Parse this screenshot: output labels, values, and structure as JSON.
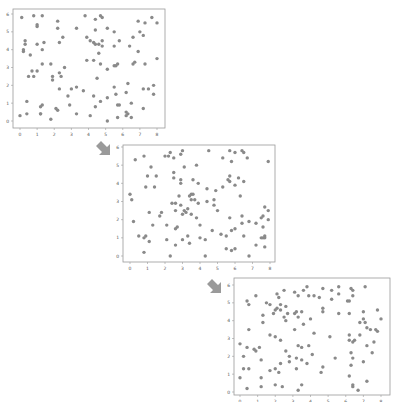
{
  "diagram": {
    "colors": {
      "point": "#8a8a8a",
      "frame": "#9a9a9a",
      "tick_text": "#555555",
      "arrow": "#9a9a9a"
    }
  },
  "chart_data": [
    {
      "type": "scatter",
      "title": "",
      "xlabel": "",
      "ylabel": "",
      "xlim": [
        -0.3,
        8.3
      ],
      "ylim": [
        -0.2,
        6.1
      ],
      "xticks": [
        "0",
        "1",
        "2",
        "3",
        "4",
        "5",
        "6",
        "7",
        "8"
      ],
      "yticks": [
        "0",
        "1",
        "2",
        "3",
        "4",
        "5",
        "6"
      ],
      "grid": false,
      "points": [
        [
          0.1,
          5.8
        ],
        [
          0.8,
          5.9
        ],
        [
          1.3,
          5.9
        ],
        [
          1.0,
          5.4
        ],
        [
          1.0,
          5.3
        ],
        [
          2.2,
          5.6
        ],
        [
          2.2,
          5.2
        ],
        [
          3.3,
          5.2
        ],
        [
          3.8,
          5.9
        ],
        [
          4.7,
          5.9
        ],
        [
          4.8,
          5.8
        ],
        [
          4.4,
          5.7
        ],
        [
          5.1,
          5.2
        ],
        [
          6.9,
          5.6
        ],
        [
          7.3,
          5.5
        ],
        [
          7.7,
          5.8
        ],
        [
          8.0,
          5.5
        ],
        [
          7.0,
          5.0
        ],
        [
          7.2,
          4.8
        ],
        [
          0.3,
          4.5
        ],
        [
          0.3,
          4.3
        ],
        [
          0.2,
          4.0
        ],
        [
          0.2,
          3.9
        ],
        [
          0.6,
          3.7
        ],
        [
          1.0,
          4.3
        ],
        [
          1.4,
          4.4
        ],
        [
          1.3,
          4.0
        ],
        [
          2.5,
          4.7
        ],
        [
          2.3,
          4.4
        ],
        [
          3.9,
          4.7
        ],
        [
          4.1,
          4.5
        ],
        [
          4.3,
          4.4
        ],
        [
          4.4,
          4.3
        ],
        [
          4.6,
          4.3
        ],
        [
          4.8,
          4.5
        ],
        [
          4.8,
          4.2
        ],
        [
          4.4,
          5.1
        ],
        [
          5.5,
          5.0
        ],
        [
          5.5,
          4.2
        ],
        [
          5.8,
          4.5
        ],
        [
          6.4,
          4.2
        ],
        [
          6.6,
          4.7
        ],
        [
          6.9,
          3.9
        ],
        [
          4.6,
          3.8
        ],
        [
          1.3,
          3.2
        ],
        [
          1.8,
          3.2
        ],
        [
          2.6,
          3.0
        ],
        [
          3.9,
          3.4
        ],
        [
          4.3,
          3.4
        ],
        [
          4.7,
          3.2
        ],
        [
          5.1,
          2.9
        ],
        [
          5.5,
          3.1
        ],
        [
          5.6,
          3.1
        ],
        [
          5.7,
          3.2
        ],
        [
          6.6,
          3.2
        ],
        [
          6.7,
          3.3
        ],
        [
          7.3,
          3.2
        ],
        [
          8.0,
          3.5
        ],
        [
          0.5,
          2.5
        ],
        [
          0.7,
          2.8
        ],
        [
          0.8,
          2.5
        ],
        [
          1.0,
          2.8
        ],
        [
          1.9,
          2.5
        ],
        [
          1.9,
          2.3
        ],
        [
          2.3,
          2.7
        ],
        [
          2.4,
          2.5
        ],
        [
          2.3,
          1.8
        ],
        [
          3.0,
          1.8
        ],
        [
          3.3,
          1.9
        ],
        [
          3.7,
          1.7
        ],
        [
          4.5,
          2.4
        ],
        [
          5.5,
          1.9
        ],
        [
          6.2,
          1.6
        ],
        [
          6.3,
          2.1
        ],
        [
          7.2,
          1.8
        ],
        [
          7.5,
          1.8
        ],
        [
          7.8,
          2.0
        ],
        [
          7.8,
          1.5
        ],
        [
          5.6,
          1.5
        ],
        [
          2.8,
          1.4
        ],
        [
          4.3,
          1.4
        ],
        [
          0.4,
          1.1
        ],
        [
          1.2,
          0.8
        ],
        [
          1.3,
          0.9
        ],
        [
          2.1,
          0.7
        ],
        [
          2.2,
          0.6
        ],
        [
          2.9,
          0.9
        ],
        [
          4.4,
          0.8
        ],
        [
          4.7,
          1.1
        ],
        [
          5.1,
          1.3
        ],
        [
          5.7,
          0.9
        ],
        [
          5.8,
          0.9
        ],
        [
          6.5,
          1.0
        ],
        [
          7.2,
          0.7
        ],
        [
          0.0,
          0.3
        ],
        [
          0.4,
          0.4
        ],
        [
          1.2,
          0.4
        ],
        [
          1.2,
          0.4
        ],
        [
          1.8,
          0.1
        ],
        [
          3.3,
          0.4
        ],
        [
          4.1,
          0.3
        ],
        [
          5.1,
          0.0
        ],
        [
          5.7,
          0.2
        ],
        [
          6.2,
          0.5
        ],
        [
          6.2,
          0.3
        ],
        [
          6.5,
          0.2
        ],
        [
          6.3,
          0.4
        ]
      ]
    },
    {
      "type": "scatter",
      "title": "",
      "xlabel": "",
      "ylabel": "",
      "xlim": [
        -0.3,
        8.3
      ],
      "ylim": [
        -0.2,
        6.1
      ],
      "xticks": [
        "0",
        "1",
        "2",
        "3",
        "4",
        "5",
        "6",
        "7",
        "8"
      ],
      "yticks": [
        "0",
        "1",
        "2",
        "3",
        "4",
        "5",
        "6"
      ],
      "grid": false,
      "points": [
        [
          0.3,
          5.3
        ],
        [
          0.8,
          5.5
        ],
        [
          2.0,
          5.5
        ],
        [
          2.2,
          5.5
        ],
        [
          2.3,
          5.7
        ],
        [
          2.5,
          5.4
        ],
        [
          2.9,
          5.6
        ],
        [
          3.0,
          5.8
        ],
        [
          4.5,
          5.8
        ],
        [
          5.3,
          5.4
        ],
        [
          5.7,
          5.8
        ],
        [
          5.8,
          5.2
        ],
        [
          6.0,
          5.7
        ],
        [
          6.4,
          5.8
        ],
        [
          6.5,
          5.7
        ],
        [
          6.7,
          5.4
        ],
        [
          7.9,
          5.2
        ],
        [
          3.1,
          4.9
        ],
        [
          3.8,
          5.0
        ],
        [
          1.2,
          4.9
        ],
        [
          1.0,
          4.4
        ],
        [
          1.5,
          4.4
        ],
        [
          2.5,
          4.6
        ],
        [
          2.5,
          4.3
        ],
        [
          2.9,
          4.2
        ],
        [
          2.9,
          4.0
        ],
        [
          3.6,
          4.2
        ],
        [
          3.9,
          4.0
        ],
        [
          4.4,
          3.7
        ],
        [
          4.9,
          3.6
        ],
        [
          5.3,
          3.8
        ],
        [
          5.6,
          4.2
        ],
        [
          5.7,
          4.1
        ],
        [
          5.7,
          4.4
        ],
        [
          6.0,
          3.9
        ],
        [
          6.2,
          4.3
        ],
        [
          6.5,
          4.1
        ],
        [
          0.9,
          3.8
        ],
        [
          1.4,
          3.8
        ],
        [
          6.3,
          3.3
        ],
        [
          0.0,
          3.4
        ],
        [
          0.1,
          3.1
        ],
        [
          2.4,
          2.9
        ],
        [
          2.6,
          2.9
        ],
        [
          2.8,
          3.3
        ],
        [
          2.9,
          2.8
        ],
        [
          3.4,
          3.3
        ],
        [
          3.5,
          3.4
        ],
        [
          3.6,
          3.4
        ],
        [
          3.5,
          3.1
        ],
        [
          3.7,
          3.1
        ],
        [
          3.9,
          2.9
        ],
        [
          4.4,
          3.0
        ],
        [
          4.8,
          3.1
        ],
        [
          4.8,
          2.8
        ],
        [
          3.1,
          2.5
        ],
        [
          3.3,
          2.6
        ],
        [
          3.2,
          2.4
        ],
        [
          3.0,
          2.3
        ],
        [
          3.5,
          2.3
        ],
        [
          5.0,
          2.5
        ],
        [
          2.6,
          2.5
        ],
        [
          0.2,
          1.9
        ],
        [
          1.1,
          2.4
        ],
        [
          1.7,
          2.2
        ],
        [
          1.8,
          2.4
        ],
        [
          1.3,
          1.7
        ],
        [
          2.1,
          1.7
        ],
        [
          2.6,
          1.5
        ],
        [
          2.7,
          1.6
        ],
        [
          3.8,
          2.1
        ],
        [
          4.0,
          1.7
        ],
        [
          5.7,
          2.1
        ],
        [
          6.4,
          1.8
        ],
        [
          6.4,
          2.2
        ],
        [
          6.8,
          1.9
        ],
        [
          7.2,
          1.8
        ],
        [
          7.5,
          2.1
        ],
        [
          7.6,
          2.2
        ],
        [
          7.7,
          2.7
        ],
        [
          7.9,
          2.5
        ],
        [
          7.9,
          2.0
        ],
        [
          5.8,
          1.4
        ],
        [
          6.0,
          1.5
        ],
        [
          7.6,
          1.6
        ],
        [
          0.5,
          1.1
        ],
        [
          0.8,
          1.0
        ],
        [
          0.9,
          1.1
        ],
        [
          1.1,
          0.8
        ],
        [
          2.1,
          0.9
        ],
        [
          2.6,
          0.6
        ],
        [
          3.0,
          0.9
        ],
        [
          3.3,
          1.1
        ],
        [
          3.4,
          0.7
        ],
        [
          4.0,
          1.0
        ],
        [
          4.3,
          0.9
        ],
        [
          4.7,
          1.4
        ],
        [
          5.2,
          1.2
        ],
        [
          5.5,
          1.1
        ],
        [
          6.5,
          1.1
        ],
        [
          7.2,
          0.6
        ],
        [
          7.5,
          1.0
        ],
        [
          7.6,
          1.0
        ],
        [
          7.7,
          1.1
        ],
        [
          7.7,
          1.0
        ],
        [
          7.7,
          0.5
        ],
        [
          0.8,
          0.2
        ],
        [
          2.3,
          0.0
        ],
        [
          4.3,
          0.0
        ],
        [
          5.5,
          0.4
        ],
        [
          5.8,
          0.3
        ],
        [
          6.0,
          0.4
        ],
        [
          6.8,
          0.0
        ]
      ]
    },
    {
      "type": "scatter",
      "title": "",
      "xlabel": "",
      "ylabel": "",
      "xlim": [
        -0.3,
        8.3
      ],
      "ylim": [
        -0.2,
        6.1
      ],
      "xticks": [
        "0",
        "1",
        "2",
        "3",
        "4",
        "5",
        "6",
        "7",
        "8"
      ],
      "yticks": [
        "0",
        "1",
        "2",
        "3",
        "4",
        "5",
        "6"
      ],
      "grid": false,
      "points": [
        [
          0.4,
          5.1
        ],
        [
          0.5,
          4.9
        ],
        [
          0.9,
          5.4
        ],
        [
          1.5,
          5.0
        ],
        [
          1.7,
          4.9
        ],
        [
          2.1,
          5.5
        ],
        [
          2.2,
          5.3
        ],
        [
          2.5,
          5.7
        ],
        [
          3.1,
          5.6
        ],
        [
          3.3,
          5.4
        ],
        [
          3.6,
          5.7
        ],
        [
          3.8,
          5.9
        ],
        [
          3.9,
          5.4
        ],
        [
          4.2,
          5.4
        ],
        [
          4.5,
          5.3
        ],
        [
          4.7,
          5.8
        ],
        [
          5.2,
          5.7
        ],
        [
          5.2,
          5.2
        ],
        [
          5.6,
          5.5
        ],
        [
          5.6,
          5.9
        ],
        [
          6.1,
          5.1
        ],
        [
          6.2,
          5.1
        ],
        [
          6.3,
          5.8
        ],
        [
          6.4,
          5.7
        ],
        [
          6.4,
          5.4
        ],
        [
          7.1,
          5.9
        ],
        [
          1.3,
          4.3
        ],
        [
          1.3,
          3.9
        ],
        [
          1.9,
          4.4
        ],
        [
          2.0,
          4.6
        ],
        [
          2.1,
          4.7
        ],
        [
          2.3,
          4.6
        ],
        [
          2.3,
          4.9
        ],
        [
          2.5,
          4.2
        ],
        [
          2.6,
          4.0
        ],
        [
          2.6,
          4.8
        ],
        [
          2.7,
          4.4
        ],
        [
          3.1,
          4.4
        ],
        [
          3.2,
          4.5
        ],
        [
          3.3,
          4.2
        ],
        [
          3.5,
          4.5
        ],
        [
          3.6,
          3.8
        ],
        [
          4.0,
          4.1
        ],
        [
          4.7,
          4.7
        ],
        [
          4.7,
          4.5
        ],
        [
          5.6,
          4.4
        ],
        [
          6.2,
          4.4
        ],
        [
          7.0,
          4.5
        ],
        [
          7.0,
          4.1
        ],
        [
          7.1,
          3.9
        ],
        [
          7.2,
          3.6
        ],
        [
          7.8,
          4.6
        ],
        [
          8.0,
          4.1
        ],
        [
          6.8,
          3.9
        ],
        [
          0.5,
          3.5
        ],
        [
          1.7,
          3.2
        ],
        [
          2.0,
          3.1
        ],
        [
          2.3,
          2.9
        ],
        [
          3.1,
          3.5
        ],
        [
          3.3,
          2.6
        ],
        [
          3.5,
          2.5
        ],
        [
          3.9,
          2.6
        ],
        [
          4.2,
          3.3
        ],
        [
          5.1,
          3.1
        ],
        [
          6.2,
          3.2
        ],
        [
          6.2,
          2.9
        ],
        [
          6.5,
          2.9
        ],
        [
          6.4,
          2.8
        ],
        [
          6.8,
          3.2
        ],
        [
          7.2,
          2.6
        ],
        [
          7.4,
          3.5
        ],
        [
          7.7,
          3.5
        ],
        [
          7.8,
          3.4
        ],
        [
          7.6,
          2.8
        ],
        [
          0.0,
          2.7
        ],
        [
          0.2,
          2.0
        ],
        [
          0.4,
          2.5
        ],
        [
          0.8,
          2.4
        ],
        [
          0.9,
          2.3
        ],
        [
          1.1,
          2.5
        ],
        [
          1.2,
          1.8
        ],
        [
          2.6,
          2.3
        ],
        [
          2.8,
          2.0
        ],
        [
          2.8,
          1.7
        ],
        [
          3.2,
          1.9
        ],
        [
          3.5,
          1.8
        ],
        [
          3.8,
          1.6
        ],
        [
          4.1,
          2.1
        ],
        [
          5.4,
          1.9
        ],
        [
          6.3,
          2.2
        ],
        [
          6.4,
          1.9
        ],
        [
          6.3,
          1.5
        ],
        [
          7.0,
          1.7
        ],
        [
          7.5,
          2.2
        ],
        [
          2.3,
          1.6
        ],
        [
          0.0,
          0.8
        ],
        [
          0.2,
          1.3
        ],
        [
          0.5,
          1.3
        ],
        [
          1.2,
          0.8
        ],
        [
          1.7,
          1.2
        ],
        [
          2.0,
          1.3
        ],
        [
          2.2,
          1.1
        ],
        [
          3.2,
          1.3
        ],
        [
          4.7,
          1.4
        ],
        [
          4.6,
          1.1
        ],
        [
          6.2,
          0.9
        ],
        [
          7.2,
          0.6
        ],
        [
          0.4,
          0.2
        ],
        [
          1.2,
          0.3
        ],
        [
          2.0,
          0.4
        ],
        [
          2.4,
          0.3
        ],
        [
          3.3,
          0.1
        ],
        [
          3.5,
          0.4
        ],
        [
          6.4,
          0.4
        ],
        [
          6.4,
          0.3
        ],
        [
          6.7,
          0.1
        ]
      ]
    }
  ],
  "arrows": [
    {
      "direction": "down-right"
    },
    {
      "direction": "down-right"
    }
  ]
}
